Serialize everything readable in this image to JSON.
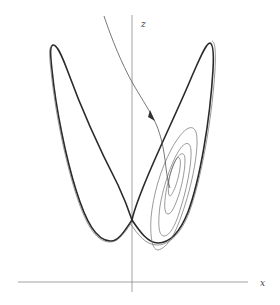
{
  "figure": {
    "title": "",
    "type": "phase-portrait",
    "projection": "x-z",
    "axes": {
      "vertical_label": "z",
      "horizontal_label": "x"
    },
    "elements": {
      "attractor": "double-lobed strange attractor (Lorenz butterfly, x-z projection)",
      "trajectory": "incoming orbit with direction arrow, spiraling into the right lobe"
    },
    "colors": {
      "background": "#ffffff",
      "curve": "#2a2a2a",
      "axis": "#8a8a8a"
    }
  }
}
